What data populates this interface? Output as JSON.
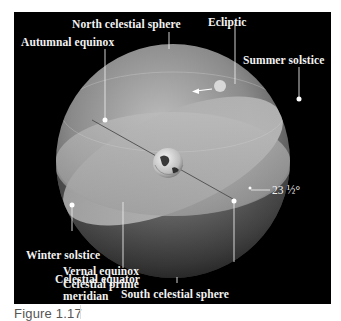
{
  "figure": {
    "caption": "Figure 1.17",
    "labels": {
      "north_celestial_sphere": "North celestial sphere",
      "ecliptic": "Ecliptic",
      "autumnal_equinox": "Autumnal equinox",
      "summer_solstice": "Summer solstice",
      "winter_solstice": "Winter solstice",
      "celestial_equator": "Celestial equator",
      "south_celestial_sphere": "South celestial sphere",
      "vernal_equinox": "Vernal equinox\nCelestial prime\nmeridian",
      "tilt_angle": "23 ½°"
    },
    "colors": {
      "background": "#000000",
      "sphere_light": "#c8c8c8",
      "sphere_dark": "#3a3a3a",
      "label_text": "#f2f2f2",
      "marker": "#ffffff"
    },
    "objects": {
      "center_body": "earth-globe",
      "sun": "sun-disk",
      "direction_arrow": "arrow-left"
    }
  }
}
